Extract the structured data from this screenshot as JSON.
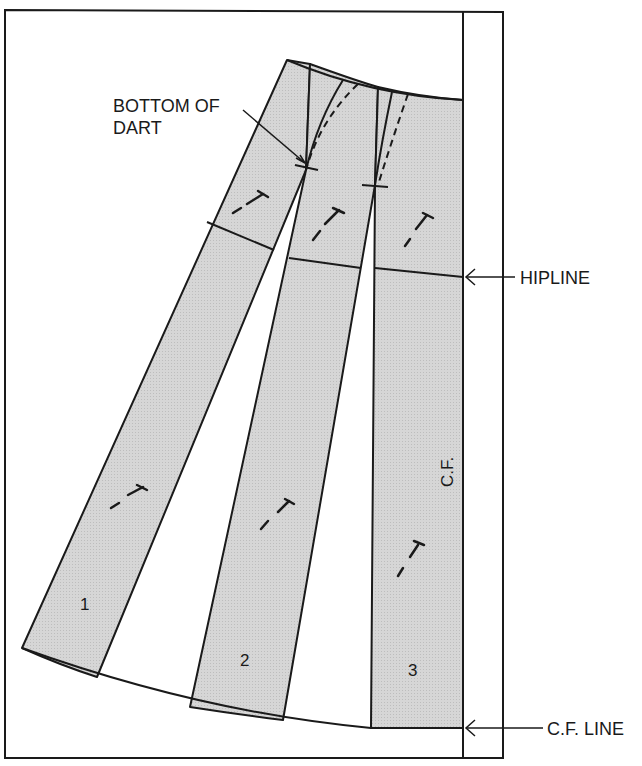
{
  "diagram": {
    "type": "sewing-pattern",
    "colors": {
      "panel_fill": "#d2d2d2",
      "line": "#1a1a1a",
      "background": "#ffffff"
    }
  },
  "labels": {
    "bottom_of_dart_line1": "BOTTOM OF",
    "bottom_of_dart_line2": "DART",
    "hipline": "HIPLINE",
    "cf_line": "C.F. LINE",
    "cf_vertical": "C.F."
  },
  "panels": [
    {
      "number": "1"
    },
    {
      "number": "2"
    },
    {
      "number": "3"
    }
  ]
}
